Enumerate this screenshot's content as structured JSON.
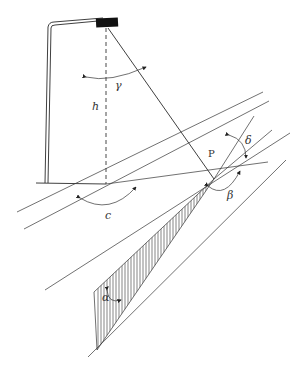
{
  "figure": {
    "colors": {
      "line": "#2a2a2a",
      "background": "#ffffff",
      "lamp_head": "#111111"
    },
    "labels": {
      "gamma": "γ",
      "h": "h",
      "P": "P",
      "delta": "δ",
      "beta": "β",
      "c": "c",
      "alpha": "α"
    }
  }
}
